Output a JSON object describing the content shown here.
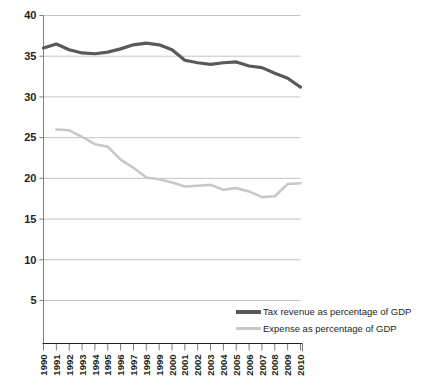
{
  "chart_data": {
    "type": "line",
    "title": "",
    "subtitle": "",
    "xlabel": "",
    "ylabel": "",
    "grid": true,
    "legend_position": "bottom-right",
    "ylim": [
      5,
      40
    ],
    "yticks": [
      5,
      10,
      15,
      20,
      25,
      30,
      35,
      40
    ],
    "ytick_labels": [
      "5",
      "10",
      "15",
      "20",
      "25",
      "30",
      "35",
      "40"
    ],
    "categories": [
      "1990",
      "1991",
      "1992",
      "1993",
      "1994",
      "1995",
      "1996",
      "1997",
      "1998",
      "1999",
      "2000",
      "2001",
      "2002",
      "2003",
      "2004",
      "2005",
      "2006",
      "2007",
      "2008",
      "2009",
      "2010"
    ],
    "series": [
      {
        "name": "Tax revenue as percentage of GDP",
        "color": "#58595b",
        "values": [
          36.0,
          36.5,
          35.8,
          35.4,
          35.3,
          35.5,
          35.9,
          36.4,
          36.6,
          36.4,
          35.8,
          34.5,
          34.2,
          34.0,
          34.2,
          34.3,
          33.8,
          33.6,
          32.9,
          32.3,
          31.2
        ]
      },
      {
        "name": "Expense as percentage of GDP",
        "color": "#c7c8ca",
        "values": [
          null,
          26.0,
          25.9,
          25.1,
          24.2,
          23.9,
          22.3,
          21.3,
          20.1,
          19.9,
          19.5,
          19.0,
          19.1,
          19.2,
          18.6,
          18.8,
          18.4,
          17.7,
          17.8,
          19.3,
          19.4
        ]
      }
    ]
  },
  "legend": {
    "items": [
      {
        "label": "Tax revenue as percentage of GDP",
        "color": "#58595b",
        "thickness": 4
      },
      {
        "label": "Expense as percentage of GDP",
        "color": "#c7c8ca",
        "thickness": 3
      }
    ]
  },
  "axes": {
    "y_tick_labels": [
      "40",
      "35",
      "30",
      "25",
      "20",
      "15",
      "10",
      "5"
    ],
    "x_tick_labels": [
      "1990",
      "1991",
      "1992",
      "1993",
      "1994",
      "1995",
      "1996",
      "1997",
      "1998",
      "1999",
      "2000",
      "2001",
      "2002",
      "2003",
      "2004",
      "2005",
      "2006",
      "2007",
      "2008",
      "2009",
      "2010"
    ]
  }
}
